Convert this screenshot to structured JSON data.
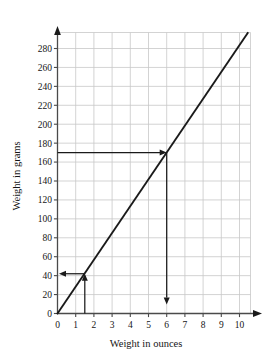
{
  "chart_data": {
    "type": "line",
    "title": "",
    "xlabel": "Weight in ounces",
    "ylabel": "Weight in grams",
    "xlim": [
      0,
      10.6
    ],
    "ylim": [
      0,
      300
    ],
    "xticks": [
      0,
      1,
      2,
      3,
      4,
      5,
      6,
      7,
      8,
      9,
      10
    ],
    "xtick_labels": [
      "0",
      "1",
      "2",
      "3",
      "4",
      "5",
      "6",
      "7",
      "8",
      "9",
      "10"
    ],
    "yticks": [
      0,
      20,
      40,
      60,
      80,
      100,
      120,
      140,
      160,
      180,
      200,
      220,
      240,
      260,
      280
    ],
    "ytick_labels": [
      "0",
      "20",
      "40",
      "60",
      "80",
      "100",
      "120",
      "140",
      "160",
      "180",
      "200",
      "220",
      "240",
      "260",
      "280"
    ],
    "grid": true,
    "legend": "none",
    "series": [
      {
        "name": "grams per ounce",
        "slope_grams_per_ounce": 28.35,
        "x": [
          0,
          10.45
        ],
        "values": [
          0,
          296.3
        ]
      }
    ],
    "annotations": [
      {
        "name": "read-up-from-1.5-ounces",
        "x": 1.5,
        "y": 42,
        "arrows": [
          "up",
          "left"
        ],
        "description": "vertical arrow up from x-axis at 1.5 ounces to the line, then horizontal arrow left to y-axis at about 42 grams"
      },
      {
        "name": "read-down-from-170-grams",
        "x": 6,
        "y": 170,
        "arrows": [
          "right",
          "down"
        ],
        "description": "horizontal arrow right from y-axis at 170 grams to the line, then vertical arrow down to x-axis at 6 ounces"
      }
    ],
    "colors": {
      "line": "#1a1a1a",
      "grid": "#c8c8c8",
      "axis": "#4a4a4a",
      "annotation": "#1a1a1a",
      "background": "#ffffff"
    }
  }
}
